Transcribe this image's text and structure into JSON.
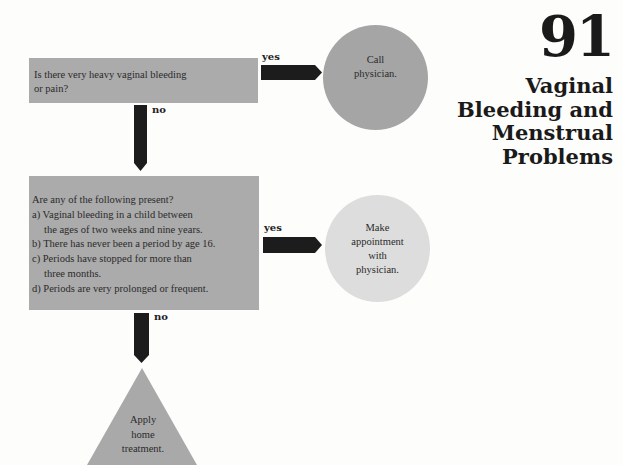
{
  "page": {
    "chapter_number": "91",
    "title_lines": [
      "Vaginal",
      "Bleeding and",
      "Menstrual",
      "Problems"
    ]
  },
  "flowchart": {
    "question1": {
      "text_lines": [
        "Is there very heavy vaginal bleeding",
        "or pain?"
      ],
      "yes_label": "yes",
      "no_label": "no"
    },
    "outcome1": {
      "text_lines": [
        "Call",
        "physician."
      ],
      "color": "#a5a5a5"
    },
    "question2": {
      "intro": "Are any of the following present?",
      "items": [
        {
          "line1": "a) Vaginal bleeding in a child between",
          "line2": "the ages of two weeks and nine years."
        },
        {
          "line1": "b) There has never been a period by age 16."
        },
        {
          "line1": "c) Periods have stopped for more than",
          "line2": "three months."
        },
        {
          "line1": "d) Periods are very prolonged or frequent."
        }
      ],
      "yes_label": "yes",
      "no_label": "no"
    },
    "outcome2": {
      "text_lines": [
        "Make",
        "appointment",
        "with",
        "physician."
      ],
      "color": "#dddddd"
    },
    "outcome3": {
      "text_lines": [
        "Apply",
        "home",
        "treatment."
      ],
      "color": "#a9a9a9"
    },
    "colors": {
      "box": "#ababab",
      "arrow": "#1c1c1c",
      "background": "#fdfdfc"
    }
  }
}
